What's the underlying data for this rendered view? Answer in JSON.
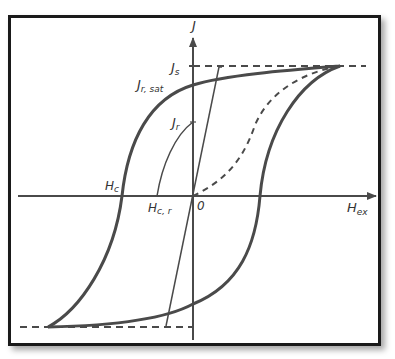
{
  "figure": {
    "axes": {
      "x_label": "H",
      "x_label_sub": "ex",
      "y_label": "J",
      "origin_label": "0"
    },
    "labels": {
      "js": "J",
      "js_sub": "s",
      "jrsat": "J",
      "jrsat_sub": "r, sat",
      "jr": "J",
      "jr_sub": "r",
      "hc": "H",
      "hc_sub": "c",
      "hcr": "H",
      "hcr_sub": "c, r"
    },
    "curves": [
      {
        "name": "major-hysteresis-loop",
        "style": "thick solid"
      },
      {
        "name": "minor-hysteresis-loop",
        "style": "thin solid"
      },
      {
        "name": "virgin-magnetization-curve",
        "style": "dashed"
      },
      {
        "name": "saturation-levels",
        "style": "dashed horizontal"
      }
    ],
    "colors": {
      "line": "#4a4a4a",
      "frame": "#1a1a1a",
      "background": "#ffffff"
    }
  }
}
